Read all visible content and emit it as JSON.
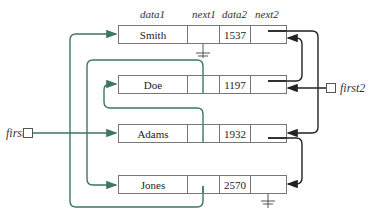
{
  "headers": {
    "data1": "data1",
    "next1": "next1",
    "data2": "data2",
    "next2": "next2"
  },
  "pointers": {
    "first1": "first1",
    "first2": "first2"
  },
  "nodes": [
    {
      "data1": "Smith",
      "data2": "1537",
      "next1": "null",
      "next2": "Adams"
    },
    {
      "data1": "Doe",
      "data2": "1197",
      "next1": "Jones",
      "next2": "Smith"
    },
    {
      "data1": "Adams",
      "data2": "1932",
      "next1": "Doe",
      "next2": "Jones"
    },
    {
      "data1": "Jones",
      "data2": "2570",
      "next1": "Smith",
      "next2": "null"
    }
  ],
  "colors": {
    "list1": "#3d7566",
    "list2": "#222222",
    "border": "#777777"
  }
}
